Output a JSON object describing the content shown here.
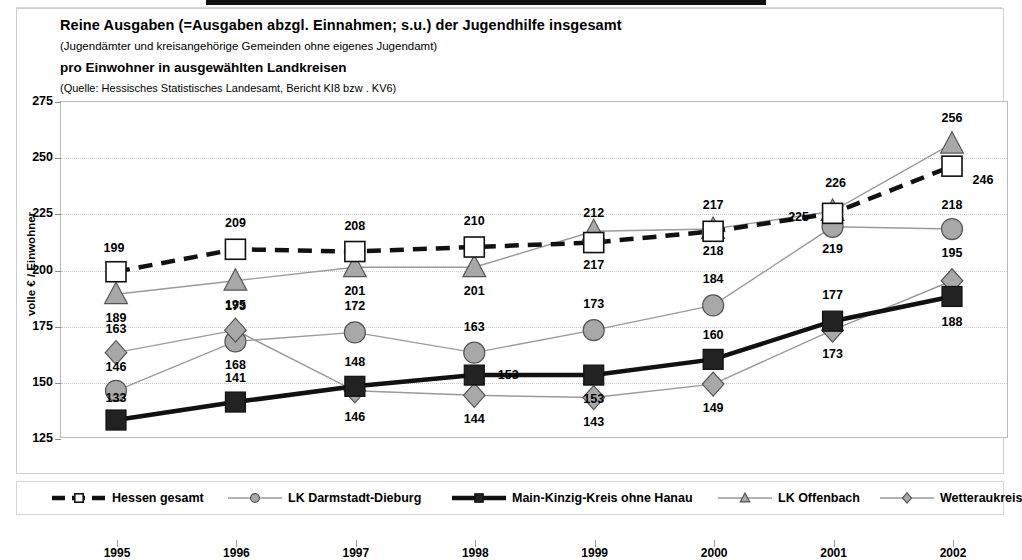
{
  "titles": {
    "line1": "Reine Ausgaben (=Ausgaben abzgl. Einnahmen; s.u.) der Jugendhilfe insgesamt",
    "line2": "(Jugendämter und kreisangehörige Gemeinden ohne eigenes Jugendamt)",
    "line3": "pro Einwohner in ausgewählten Landkreisen",
    "line4": "(Quelle: Hessisches Statistisches Landesamt, Bericht KI8 bzw . KV6)"
  },
  "axis": {
    "ylabel": "volle € / Einwohner",
    "yticks": [
      "275",
      "250",
      "225",
      "200",
      "175",
      "150",
      "125"
    ],
    "xticks": [
      "1995",
      "1996",
      "1997",
      "1998",
      "1999",
      "2000",
      "2001",
      "2002"
    ]
  },
  "colors": {
    "hessen": "#111111",
    "darmstadt": "#9a9a9a",
    "mainkinzig": "#111111",
    "offenbach": "#9a9a9a",
    "wetterau": "#9a9a9a",
    "marker_fill": "#a8a8a8",
    "grid": "#c8c8c8",
    "frame": "#b9b9b9"
  },
  "chart_data": {
    "type": "line",
    "xlabel": "",
    "ylabel": "volle € / Einwohner",
    "categories": [
      "1995",
      "1996",
      "1997",
      "1998",
      "1999",
      "2000",
      "2001",
      "2002"
    ],
    "ylim": [
      125,
      275
    ],
    "ytick_step": 25,
    "grid": true,
    "legend_position": "bottom",
    "series": [
      {
        "name": "Hessen gesamt",
        "marker": "open-square",
        "style": "dashed-thick-black",
        "values": [
          199,
          209,
          208,
          210,
          212,
          217,
          225,
          246
        ]
      },
      {
        "name": "LK Darmstadt-Dieburg",
        "marker": "filled-circle",
        "style": "thin-gray",
        "values": [
          146,
          168,
          172,
          163,
          173,
          184,
          219,
          218
        ]
      },
      {
        "name": "Main-Kinzig-Kreis ohne Hanau",
        "marker": "filled-square",
        "style": "thick-black",
        "values": [
          133,
          141,
          148,
          153,
          153,
          160,
          177,
          188
        ]
      },
      {
        "name": "LK Offenbach",
        "marker": "filled-triangle",
        "style": "thin-gray",
        "values": [
          189,
          195,
          201,
          201,
          217,
          218,
          226,
          256
        ]
      },
      {
        "name": "Wetteraukreis",
        "marker": "filled-diamond",
        "style": "thin-gray",
        "values": [
          163,
          173,
          146,
          144,
          143,
          149,
          173,
          195
        ]
      }
    ]
  },
  "legend": [
    {
      "label": "Hessen gesamt",
      "marker": "open-square"
    },
    {
      "label": "LK Darmstadt-Dieburg",
      "marker": "filled-circle"
    },
    {
      "label": "Main-Kinzig-Kreis ohne Hanau",
      "marker": "filled-square"
    },
    {
      "label": "LK Offenbach",
      "marker": "filled-triangle"
    },
    {
      "label": "Wetteraukreis",
      "marker": "filled-diamond"
    }
  ],
  "data_labels": [
    {
      "text": "199",
      "x": 0,
      "v": 199,
      "dx": -2,
      "dy": -24
    },
    {
      "text": "209",
      "x": 1,
      "v": 209,
      "dx": 0,
      "dy": -26
    },
    {
      "text": "208",
      "x": 2,
      "v": 208,
      "dx": 0,
      "dy": -26
    },
    {
      "text": "210",
      "x": 3,
      "v": 210,
      "dx": 0,
      "dy": -26
    },
    {
      "text": "212",
      "x": 4,
      "v": 212,
      "dx": 0,
      "dy": -30
    },
    {
      "text": "217",
      "x": 4,
      "v": 212,
      "dx": 0,
      "dy": 22
    },
    {
      "text": "217",
      "x": 5,
      "v": 217,
      "dx": 0,
      "dy": -26
    },
    {
      "text": "218",
      "x": 5,
      "v": 218,
      "dx": 0,
      "dy": 22
    },
    {
      "text": "226",
      "x": 6,
      "v": 226,
      "dx": 3,
      "dy": -28
    },
    {
      "text": "225",
      "x": 6,
      "v": 225,
      "dx": -34,
      "dy": 4
    },
    {
      "text": "219",
      "x": 6,
      "v": 219,
      "dx": 0,
      "dy": 22
    },
    {
      "text": "256",
      "x": 7,
      "v": 256,
      "dx": 0,
      "dy": -26
    },
    {
      "text": "246",
      "x": 7,
      "v": 246,
      "dx": 31,
      "dy": 14
    },
    {
      "text": "189",
      "x": 0,
      "v": 189,
      "dx": 0,
      "dy": 24
    },
    {
      "text": "195",
      "x": 1,
      "v": 195,
      "dx": 0,
      "dy": 24
    },
    {
      "text": "201",
      "x": 2,
      "v": 201,
      "dx": 0,
      "dy": 24
    },
    {
      "text": "201",
      "x": 3,
      "v": 201,
      "dx": 0,
      "dy": 24
    },
    {
      "text": "218",
      "x": 7,
      "v": 218,
      "dx": 0,
      "dy": -24
    },
    {
      "text": "163",
      "x": 0,
      "v": 163,
      "dx": 0,
      "dy": -24
    },
    {
      "text": "173",
      "x": 1,
      "v": 173,
      "dx": 0,
      "dy": -24
    },
    {
      "text": "172",
      "x": 2,
      "v": 172,
      "dx": 0,
      "dy": -26
    },
    {
      "text": "163",
      "x": 3,
      "v": 163,
      "dx": 0,
      "dy": -26
    },
    {
      "text": "173",
      "x": 4,
      "v": 173,
      "dx": 0,
      "dy": -26
    },
    {
      "text": "184",
      "x": 5,
      "v": 184,
      "dx": 0,
      "dy": -26
    },
    {
      "text": "146",
      "x": 0,
      "v": 146,
      "dx": 0,
      "dy": -24
    },
    {
      "text": "168",
      "x": 1,
      "v": 168,
      "dx": 0,
      "dy": 24
    },
    {
      "text": "153",
      "x": 3,
      "v": 153,
      "dx": 34,
      "dy": 0
    },
    {
      "text": "153",
      "x": 4,
      "v": 153,
      "dx": 0,
      "dy": 24
    },
    {
      "text": "160",
      "x": 5,
      "v": 160,
      "dx": 0,
      "dy": -24
    },
    {
      "text": "177",
      "x": 6,
      "v": 177,
      "dx": 0,
      "dy": -26
    },
    {
      "text": "195",
      "x": 7,
      "v": 195,
      "dx": 0,
      "dy": -28
    },
    {
      "text": "133",
      "x": 0,
      "v": 133,
      "dx": 0,
      "dy": -22
    },
    {
      "text": "141",
      "x": 1,
      "v": 141,
      "dx": 0,
      "dy": -24
    },
    {
      "text": "148",
      "x": 2,
      "v": 148,
      "dx": 0,
      "dy": -24
    },
    {
      "text": "146",
      "x": 2,
      "v": 146,
      "dx": 0,
      "dy": 26
    },
    {
      "text": "144",
      "x": 3,
      "v": 144,
      "dx": 0,
      "dy": 24
    },
    {
      "text": "143",
      "x": 4,
      "v": 143,
      "dx": 0,
      "dy": 24
    },
    {
      "text": "149",
      "x": 5,
      "v": 149,
      "dx": 0,
      "dy": 24
    },
    {
      "text": "173",
      "x": 6,
      "v": 173,
      "dx": 0,
      "dy": 24
    },
    {
      "text": "188",
      "x": 7,
      "v": 188,
      "dx": 0,
      "dy": 26
    }
  ]
}
